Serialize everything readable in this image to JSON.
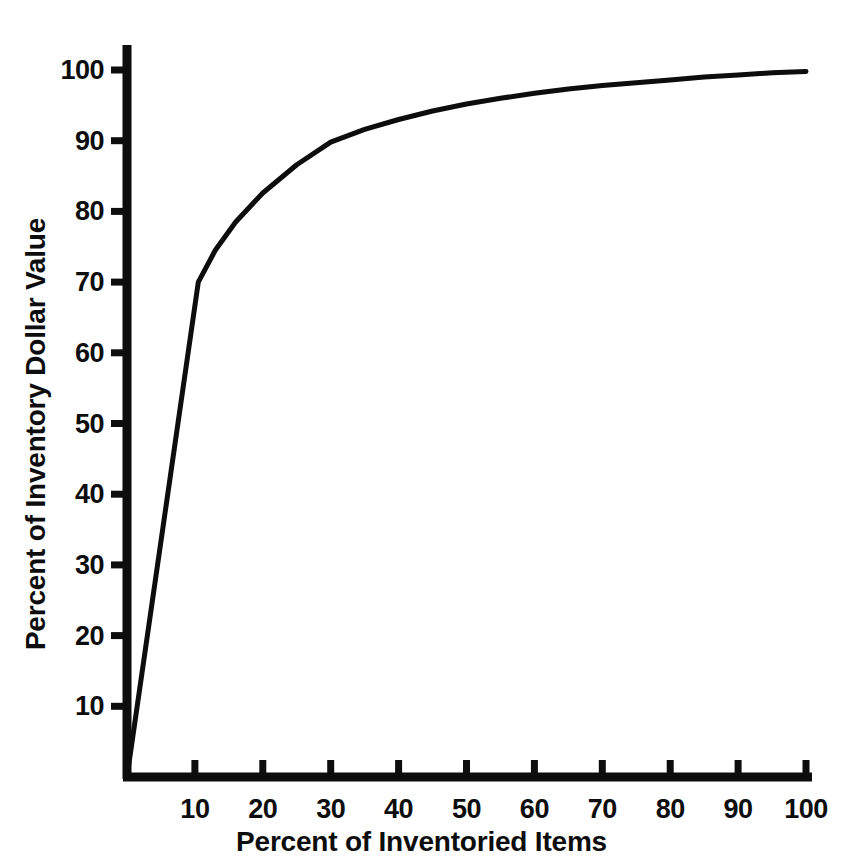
{
  "chart_data": {
    "type": "line",
    "title": "",
    "subtitle": "",
    "xlabel": "Percent of Inventoried Items",
    "ylabel": "Percent of Inventory Dollar Value",
    "xlim": [
      0,
      100
    ],
    "ylim": [
      0,
      100
    ],
    "xticks": [
      10,
      20,
      30,
      40,
      50,
      60,
      70,
      80,
      90,
      100
    ],
    "yticks": [
      10,
      20,
      30,
      40,
      50,
      60,
      70,
      80,
      90,
      100
    ],
    "xtick_labels": [
      "10",
      "20",
      "30",
      "40",
      "50",
      "60",
      "70",
      "80",
      "90",
      "100"
    ],
    "ytick_labels": [
      "10",
      "20",
      "30",
      "40",
      "50",
      "60",
      "70",
      "80",
      "90",
      "100"
    ],
    "grid": false,
    "legend": false,
    "legend_position": "none",
    "line_color": "#0d0d0d",
    "line_width": 5,
    "background_color": "#ffffff",
    "axis_color": "#0d0d0d",
    "series": [
      {
        "name": "Cumulative inventory dollar value",
        "x": [
          0,
          10.5,
          13,
          16,
          20,
          25,
          30,
          35,
          40,
          45,
          50,
          55,
          60,
          65,
          70,
          75,
          80,
          85,
          90,
          95,
          100
        ],
        "values": [
          0,
          70,
          74.5,
          78.5,
          82.6,
          86.6,
          89.8,
          91.6,
          93.0,
          94.2,
          95.2,
          96.0,
          96.7,
          97.3,
          97.8,
          98.2,
          98.6,
          99.0,
          99.3,
          99.6,
          99.8
        ]
      }
    ],
    "annotations": [
      {
        "text": "knee of curve",
        "x": 10.5,
        "y": 70,
        "visible": false
      }
    ]
  }
}
